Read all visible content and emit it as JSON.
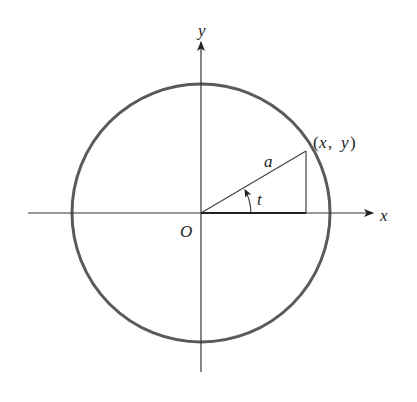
{
  "diagram": {
    "type": "unit-circle-parametric",
    "labels": {
      "y_axis": "y",
      "x_axis": "x",
      "origin": "O",
      "radius": "a",
      "angle": "t",
      "point": "(x,  y)",
      "point_open": "(",
      "point_x": "x",
      "point_comma": ",",
      "point_y": "y",
      "point_close": ")"
    },
    "colors": {
      "circle": "#5a5a5a",
      "axes": "#333333",
      "lines": "#444444",
      "text": "#222222",
      "background": "#ffffff"
    },
    "geometry": {
      "center": [
        201,
        213
      ],
      "circle_radius": 129,
      "point_on_circle": [
        306,
        151
      ],
      "x_axis_range": [
        28,
        375
      ],
      "y_axis_range": [
        12,
        372
      ],
      "angle_arc_radius": 50
    }
  }
}
